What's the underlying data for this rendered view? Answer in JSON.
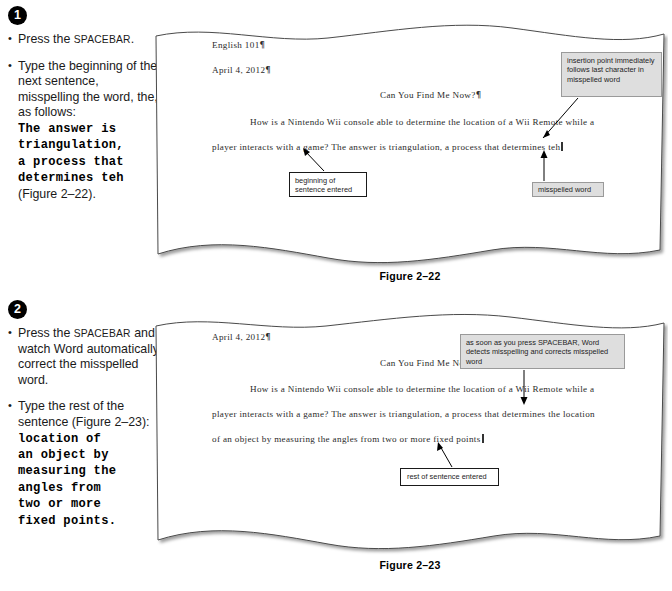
{
  "steps": [
    {
      "number": "1",
      "bullets": [
        {
          "id": "s1b1",
          "parts": [
            {
              "type": "text",
              "value": "Press the "
            },
            {
              "type": "smallcaps",
              "value": "SPACEBAR"
            },
            {
              "type": "text",
              "value": "."
            }
          ]
        },
        {
          "id": "s1b2",
          "parts": [
            {
              "type": "text",
              "value": "Type the beginning of the next sentence, misspelling the word, the, as follows:"
            },
            {
              "type": "mono",
              "value": "The answer is\ntriangulation,\na process that\ndetermines teh"
            },
            {
              "type": "text",
              "value": "(Figure 2–22)."
            }
          ]
        }
      ]
    },
    {
      "number": "2",
      "bullets": [
        {
          "id": "s2b1",
          "parts": [
            {
              "type": "text",
              "value": "Press the "
            },
            {
              "type": "smallcaps",
              "value": "SPACEBAR"
            },
            {
              "type": "text",
              "value": " and watch Word automatically correct the misspelled word."
            }
          ]
        },
        {
          "id": "s2b2",
          "parts": [
            {
              "type": "text",
              "value": "Type the rest of the sentence (Figure 2–23):"
            },
            {
              "type": "mono",
              "value": "location of\nan object by\nmeasuring the\nangles from\ntwo or more\nfixed points."
            }
          ]
        }
      ]
    }
  ],
  "figures": [
    {
      "id": "figure-2-22",
      "caption": "Figure 2–22",
      "document_lines": [
        {
          "id": "f1l1",
          "text": "English  101",
          "pilcrow": true,
          "x": 60,
          "y": 18,
          "align": "left"
        },
        {
          "id": "f1l2",
          "text": "April 4, 2012",
          "pilcrow": true,
          "x": 60,
          "y": 43,
          "align": "left"
        },
        {
          "id": "f1l3",
          "text": "Can You Find Me Now?",
          "pilcrow": true,
          "x": 228,
          "y": 68,
          "align": "left"
        },
        {
          "id": "f1l4",
          "text": "How is a Nintendo  Wii  console  able  to  determine   the location   of a Wii  Remote  while   a",
          "pilcrow": false,
          "x": 98,
          "y": 95,
          "align": "left"
        },
        {
          "id": "f1l5a",
          "text": "player  interacts   with  a game?  The  answer  is  triangulation,   a process that  determines   teh",
          "pilcrow": false,
          "x": 60,
          "y": 120,
          "align": "left",
          "caret": true
        }
      ],
      "callouts": [
        {
          "id": "callout-insertion-point",
          "style": "gray",
          "text": "insertion point immediately follows last character in misspelled word",
          "x": 409,
          "y": 30,
          "w": 101,
          "h": 45
        },
        {
          "id": "callout-beginning-of-sentence",
          "style": "white",
          "text": "beginning of sentence entered",
          "x": 137,
          "y": 150,
          "w": 78,
          "h": 25
        },
        {
          "id": "callout-misspelled-word",
          "style": "gray",
          "text": "misspelled word",
          "x": 380,
          "y": 160,
          "w": 72,
          "h": 15
        }
      ]
    },
    {
      "id": "figure-2-23",
      "caption": "Figure 2–23",
      "document_lines": [
        {
          "id": "f2l1",
          "text": "April 4, 2012",
          "pilcrow": true,
          "x": 60,
          "y": 20,
          "align": "left"
        },
        {
          "id": "f2l2",
          "text": "Can You Find Me Now?",
          "pilcrow": true,
          "x": 228,
          "y": 46,
          "align": "left"
        },
        {
          "id": "f2l3",
          "text": "How is a Nintendo  Wii  console  able  to  determine   the location   of a Wii  Remote  while   a",
          "pilcrow": false,
          "x": 98,
          "y": 72,
          "align": "left"
        },
        {
          "id": "f2l4",
          "text": "player  interacts   with  a game?  The  answer  is  triangulation,   a process that  determines   the location",
          "pilcrow": false,
          "x": 60,
          "y": 97,
          "align": "left"
        },
        {
          "id": "f2l5",
          "text": "of an object by measuring  the  angles  from  two  or more  fixed  points",
          "pilcrow": false,
          "x": 60,
          "y": 122,
          "align": "left",
          "caret": true
        }
      ],
      "callouts": [
        {
          "id": "callout-spacebar-autocorrect",
          "style": "gray",
          "text": "as soon as you press SPACEBAR, Word detects misspelling and corrects misspelled word",
          "x": 308,
          "y": 22,
          "w": 165,
          "h": 35
        },
        {
          "id": "callout-rest-of-sentence",
          "style": "white",
          "text": "rest of sentence entered",
          "x": 248,
          "y": 156,
          "w": 99,
          "h": 18
        }
      ]
    }
  ],
  "colors": {
    "page_background": "#ffffff",
    "callout_gray": "#dedede",
    "callout_gray_border": "#9a9a9a",
    "callout_white_border": "#1a1a1a",
    "badge_fill": "#000000",
    "badge_text": "#ffffff",
    "paper_edge": "#4a4a4a",
    "document_text": "#2a2a2a"
  }
}
